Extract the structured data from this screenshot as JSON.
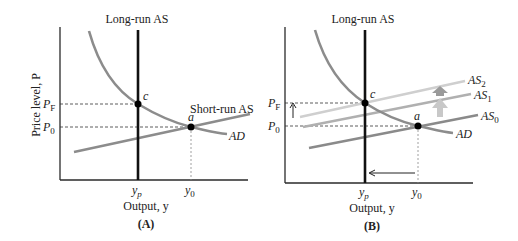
{
  "panels": [
    {
      "id": "A",
      "caption": "(A)",
      "y_axis_label": "Price level, P",
      "x_axis_label": "Output, y",
      "curve_labels": {
        "long_run_as": "Long-run AS",
        "short_run_as": "Short-run AS",
        "ad": "AD"
      },
      "tick_labels": {
        "pf_base": "P",
        "pf_sub": "F",
        "p0_base": "P",
        "p0_sub": "0",
        "yp_base": "y",
        "yp_sub": "p",
        "y0_base": "y",
        "y0_sub": "0"
      },
      "points": {
        "c": "c",
        "a": "a"
      }
    },
    {
      "id": "B",
      "caption": "(B)",
      "x_axis_label": "Output, y",
      "curve_labels": {
        "long_run_as": "Long-run AS",
        "as0_base": "AS",
        "as0_sub": "0",
        "as1_base": "AS",
        "as1_sub": "1",
        "as2_base": "AS",
        "as2_sub": "2",
        "ad": "AD"
      },
      "tick_labels": {
        "pf_base": "P",
        "pf_sub": "F",
        "p0_base": "P",
        "p0_sub": "0",
        "yp_base": "y",
        "yp_sub": "p",
        "y0_base": "y",
        "y0_sub": "0"
      },
      "points": {
        "c": "c",
        "a": "a"
      }
    }
  ],
  "colors": {
    "axis": "#2a2a2a",
    "lras": "#111111",
    "ad": "#8c8c8c",
    "sras": "#8c8c8c",
    "as0": "#8a8a8a",
    "as1": "#b0b0b0",
    "as2": "#cfcfcf",
    "shift_arrow_dark": "#9a9a9a",
    "shift_arrow_light": "#c8c8c8"
  }
}
